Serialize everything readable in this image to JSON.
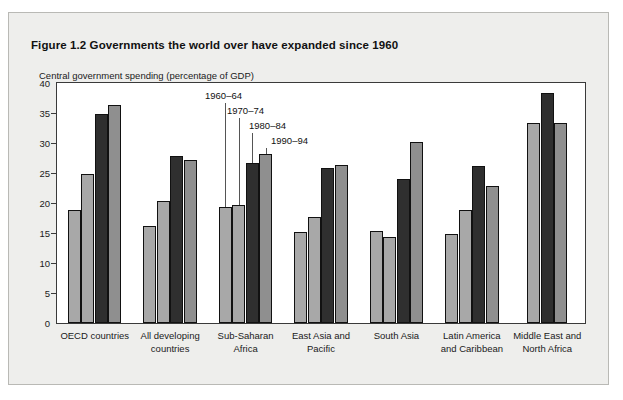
{
  "figure": {
    "title": "Figure 1.2  Governments the world over have expanded since 1960",
    "axis_caption": "Central government spending (percentage of GDP)"
  },
  "colors": {
    "page_background": "#ffffff",
    "card_background": "#eeeeec",
    "plot_background": "#ffffff",
    "rule": "#0a0a0a",
    "bar_light": "#a8a8a8",
    "bar_mid": "#8f8f8f",
    "bar_dark": "#2f2f2f",
    "bar_outline": "#111111"
  },
  "chart_data": {
    "type": "bar",
    "title": "Figure 1.2  Governments the world over have expanded since 1960",
    "xlabel": "",
    "ylabel": "Central government spending (percentage of GDP)",
    "ylim": [
      0,
      40
    ],
    "yticks": [
      0,
      5,
      10,
      15,
      20,
      25,
      30,
      35,
      40
    ],
    "grid": false,
    "legend": "inline-annotations",
    "categories": [
      "OECD countries",
      "All developing countries",
      "Sub-Saharan Africa",
      "East Asia and Pacific",
      "South Asia",
      "Latin America and Caribbean",
      "Middle East and North Africa"
    ],
    "category_lines": [
      [
        "OECD countries"
      ],
      [
        "All developing",
        "countries"
      ],
      [
        "Sub-Saharan",
        "Africa"
      ],
      [
        "East Asia and",
        "Pacific"
      ],
      [
        "South Asia"
      ],
      [
        "Latin America",
        "and Caribbean"
      ],
      [
        "Middle East and",
        "North Africa"
      ]
    ],
    "series": [
      {
        "name": "1960–64",
        "shade": "light",
        "values": [
          18.8,
          16.2,
          19.4,
          15.2,
          15.4,
          14.8,
          null
        ]
      },
      {
        "name": "1970–74",
        "shade": "light",
        "values": [
          24.9,
          20.4,
          19.6,
          17.6,
          14.4,
          18.9,
          33.4
        ]
      },
      {
        "name": "1980–84",
        "shade": "dark",
        "values": [
          34.8,
          27.8,
          26.7,
          25.9,
          24.0,
          26.2,
          38.4
        ]
      },
      {
        "name": "1990–94",
        "shade": "mid",
        "values": [
          36.4,
          27.1,
          28.2,
          26.3,
          30.1,
          22.9,
          33.4
        ]
      }
    ],
    "annotations": [
      {
        "label": "1960–64"
      },
      {
        "label": "1970–74"
      },
      {
        "label": "1980–84"
      },
      {
        "label": "1990–94"
      }
    ]
  }
}
